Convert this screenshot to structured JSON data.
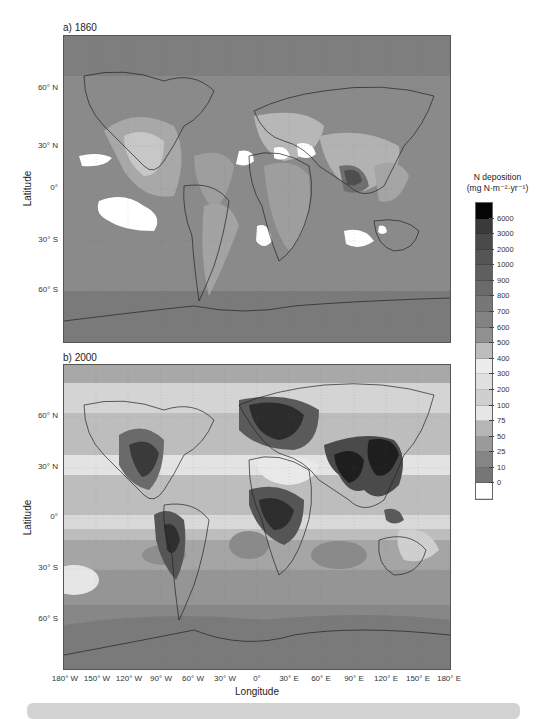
{
  "figure": {
    "panels": [
      {
        "id": "a",
        "title": "a) 1860"
      },
      {
        "id": "b",
        "title": "b) 2000"
      }
    ],
    "y_axis_title": "Latitude",
    "x_axis_title": "Longitude",
    "lat_ticks": [
      "60° N",
      "30° N",
      "0°",
      "30° S",
      "60° S"
    ],
    "lon_ticks": [
      "180° W",
      "150° W",
      "120° W",
      "90° W",
      "60° W",
      "30° W",
      "0°",
      "30° E",
      "60° E",
      "90° E",
      "120° E",
      "150° E",
      "180° E"
    ]
  },
  "colorbar": {
    "title_line1": "N deposition",
    "title_line2": "(mg N·m⁻²·yr⁻¹)",
    "levels": [
      "6000",
      "3000",
      "2000",
      "1000",
      "900",
      "800",
      "700",
      "600",
      "500",
      "400",
      "300",
      "200",
      "100",
      "75",
      "50",
      "25",
      "10",
      "0"
    ],
    "colors": [
      "#050505",
      "#3a3a3a",
      "#4a4a4a",
      "#555555",
      "#5f5f5f",
      "#6a6a6a",
      "#777777",
      "#838383",
      "#909090",
      "#bdbdbd",
      "#ececec",
      "#e0e0e0",
      "#cfcfcf",
      "#e6e6e6",
      "#b5b5b5",
      "#9a9a9a",
      "#858585",
      "#767676",
      "#ffffff"
    ]
  },
  "map_data": {
    "type": "choropleth-raster",
    "variable": "N deposition",
    "units": "mg N·m⁻²·yr⁻¹",
    "projection": "equirectangular",
    "lon_range": [
      -180,
      180
    ],
    "lat_range": [
      -90,
      90
    ],
    "panels": [
      {
        "title": "a) 1860",
        "summary": "Low deposition globally (mostly 10–100); moderate over eastern US, Europe, India, eastern China (up to ~500–1000 over Ganges basin); near-zero (white) patches over subtropical Pacific, Atlantic, Sahara and southern Indian Ocean."
      },
      {
        "title": "b) 2000",
        "summary": "High deposition (1000–6000) over eastern North America, Europe, South/East Asia, Central Africa, South America; ocean bands 50–300; low values (10–25) in Southern Ocean and Antarctica."
      }
    ]
  }
}
